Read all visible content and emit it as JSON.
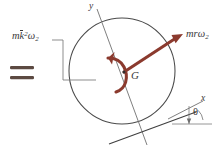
{
  "figure": {
    "type": "engineering-mechanics-free-body-diagram",
    "background_color": "#ffffff",
    "equals_sign": "=",
    "labels": {
      "moment_label_prefix": "m",
      "moment_label_k": "k",
      "moment_label_exponent": "2",
      "moment_label_omega": "ω",
      "moment_label_subscript": "2",
      "momentum_label_prefix": "mr",
      "momentum_label_omega": "ω",
      "momentum_label_subscript": "2",
      "center_point": "G",
      "axis_y": "y",
      "axis_x": "x",
      "angle": "θ"
    },
    "colors": {
      "vector_red": "#8B3A2E",
      "line_gray": "#4a4a4a",
      "leader_gray": "#6e6e6e",
      "text_gray": "#3a3a3a",
      "equals_color": "#5c4a42"
    },
    "geometry": {
      "circle_center_x": 122,
      "circle_center_y": 71,
      "circle_radius": 53,
      "vector_tail_x": 124,
      "vector_tail_y": 72,
      "vector_tip_x": 183,
      "vector_tip_y": 34,
      "incline_angle_degrees": 20
    }
  }
}
